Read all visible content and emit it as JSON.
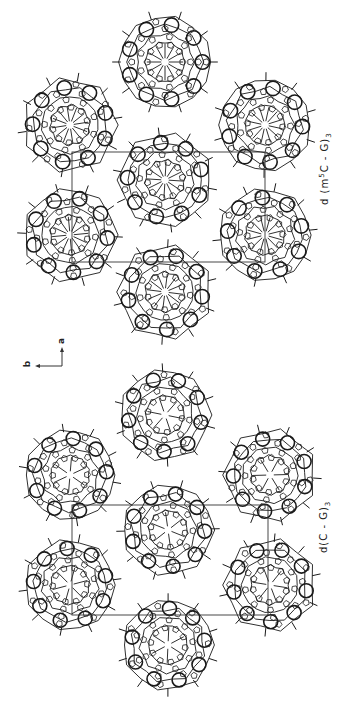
{
  "figure": {
    "orientation": "rotated-90-ccw",
    "background": "#ffffff",
    "line_color": "#1a1a1a"
  },
  "panels": [
    {
      "id": "top",
      "label_html": "d (m5C - G)3",
      "label_parts": {
        "prefix": "d (m",
        "sup": "5",
        "mid": "C - G)",
        "sub": "3"
      },
      "clusters": [
        {
          "cx": 165,
          "cy": 62,
          "r": 48
        },
        {
          "cx": 70,
          "cy": 125,
          "r": 48
        },
        {
          "cx": 265,
          "cy": 125,
          "r": 48
        },
        {
          "cx": 165,
          "cy": 180,
          "r": 48
        },
        {
          "cx": 70,
          "cy": 235,
          "r": 48
        },
        {
          "cx": 265,
          "cy": 235,
          "r": 48
        },
        {
          "cx": 165,
          "cy": 292,
          "r": 48
        }
      ],
      "unit_cell": {
        "x1": 72,
        "y1": 152,
        "x2": 265,
        "y2": 262
      }
    },
    {
      "id": "bottom",
      "label_parts": {
        "prefix": "d(C - G)",
        "sup": "",
        "mid": "",
        "sub": "3"
      },
      "clusters": [
        {
          "cx": 165,
          "cy": 415,
          "r": 47
        },
        {
          "cx": 70,
          "cy": 475,
          "r": 47
        },
        {
          "cx": 270,
          "cy": 475,
          "r": 47
        },
        {
          "cx": 168,
          "cy": 530,
          "r": 47
        },
        {
          "cx": 70,
          "cy": 585,
          "r": 47
        },
        {
          "cx": 270,
          "cy": 585,
          "r": 47
        },
        {
          "cx": 168,
          "cy": 645,
          "r": 47
        }
      ],
      "unit_cell": {
        "x1": 72,
        "y1": 505,
        "x2": 268,
        "y2": 615
      }
    }
  ],
  "axes_indicator": {
    "label_a": "a",
    "label_b": "b",
    "origin_x": 62,
    "origin_y": 366
  }
}
